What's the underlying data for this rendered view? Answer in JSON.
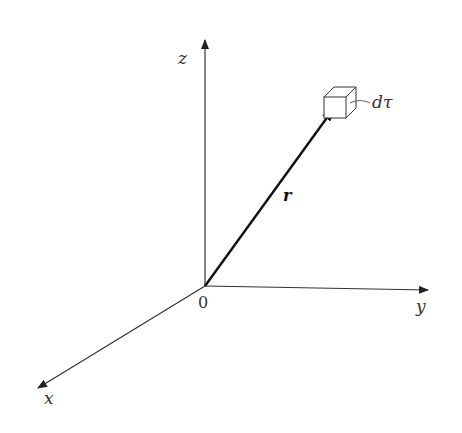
{
  "diagram": {
    "title": "",
    "origin": {
      "label": "0",
      "x": 205,
      "y": 286
    },
    "axes": [
      {
        "name": "z",
        "label": "z",
        "end": [
          205,
          40
        ]
      },
      {
        "name": "y",
        "label": "y",
        "end": [
          428,
          290
        ]
      },
      {
        "name": "x",
        "label": "x",
        "end": [
          38,
          388
        ]
      }
    ],
    "vector": {
      "label": "r",
      "from": [
        205,
        286
      ],
      "to": [
        335,
        106
      ]
    },
    "volume_element": {
      "label": "dτ"
    },
    "colors": {
      "line": "#333333",
      "vector": "#111111"
    }
  }
}
